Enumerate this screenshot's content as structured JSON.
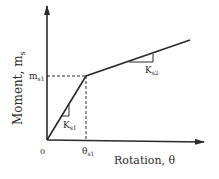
{
  "diagram": {
    "type": "bilinear moment-rotation curve",
    "y_axis_label": "Moment, m",
    "y_axis_label_sub": "s",
    "x_axis_label": "Rotation, θ",
    "origin_label": "0",
    "yield_moment_label": "m",
    "yield_moment_sub": "s1",
    "yield_rotation_label": "θ",
    "yield_rotation_sub": "s1",
    "initial_stiffness_label": "K",
    "initial_stiffness_sub": "s1",
    "post_yield_stiffness_label": "K",
    "post_yield_stiffness_sub": "s2"
  },
  "colors": {
    "line": "#2a2a2a",
    "background": "#ffffff"
  }
}
